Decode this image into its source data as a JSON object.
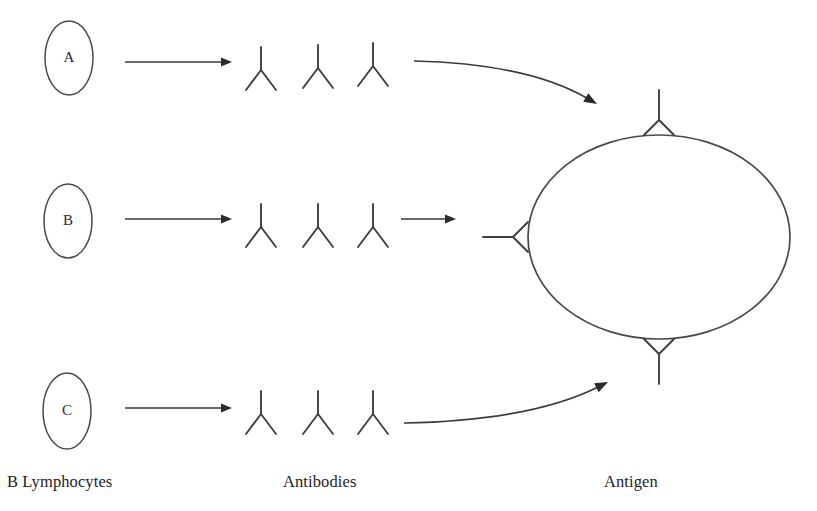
{
  "figure": {
    "background_color": "#ffffff",
    "ink_color": "#3a3a3a"
  },
  "columns": [
    {
      "id": "lymphocytes",
      "label": "B Lymphocytes",
      "x": 7,
      "y": 472
    },
    {
      "id": "antibodies",
      "label": "Antibodies",
      "x": 283,
      "y": 472
    },
    {
      "id": "antigen",
      "label": "Antigen",
      "x": 604,
      "y": 472
    }
  ],
  "lymphocytes": [
    {
      "id": "cell-a",
      "letter": "A",
      "cx": 69,
      "cy": 58,
      "rx": 24,
      "ry": 37
    },
    {
      "id": "cell-b",
      "letter": "B",
      "cx": 68,
      "cy": 221,
      "rx": 24,
      "ry": 37
    },
    {
      "id": "cell-c",
      "letter": "C",
      "cx": 67,
      "cy": 411,
      "rx": 24,
      "ry": 38
    }
  ],
  "production_arrows": [
    {
      "id": "arrow-a",
      "x1": 125,
      "y1": 62,
      "x2": 232,
      "y2": 62
    },
    {
      "id": "arrow-b",
      "x1": 125,
      "y1": 219,
      "x2": 232,
      "y2": 219
    },
    {
      "id": "arrow-c",
      "x1": 125,
      "y1": 408,
      "x2": 232,
      "y2": 408
    }
  ],
  "free_antibodies": [
    {
      "id": "ab-a1",
      "cx": 261,
      "cy": 70,
      "row": "A"
    },
    {
      "id": "ab-a2",
      "cx": 318,
      "cy": 68,
      "row": "A"
    },
    {
      "id": "ab-a3",
      "cx": 373,
      "cy": 66,
      "row": "A"
    },
    {
      "id": "ab-b1",
      "cx": 261,
      "cy": 227,
      "row": "B"
    },
    {
      "id": "ab-b2",
      "cx": 318,
      "cy": 227,
      "row": "B"
    },
    {
      "id": "ab-b3",
      "cx": 373,
      "cy": 227,
      "row": "B"
    },
    {
      "id": "ab-c1",
      "cx": 261,
      "cy": 414,
      "row": "C"
    },
    {
      "id": "ab-c2",
      "cx": 318,
      "cy": 414,
      "row": "C"
    },
    {
      "id": "ab-c3",
      "cx": 373,
      "cy": 414,
      "row": "C"
    }
  ],
  "binding_arrows": [
    {
      "id": "binding-arrow-top",
      "type": "curved",
      "from_x": 414,
      "from_y": 61,
      "to_x": 597,
      "to_y": 104,
      "direction": "down-right"
    },
    {
      "id": "binding-arrow-middle",
      "type": "straight",
      "from_x": 401,
      "from_y": 219,
      "to_x": 456,
      "to_y": 219,
      "direction": "right"
    },
    {
      "id": "binding-arrow-bottom",
      "type": "curved",
      "from_x": 404,
      "from_y": 423,
      "to_x": 608,
      "to_y": 382,
      "direction": "up-right"
    }
  ],
  "antigen": {
    "id": "antigen-body",
    "cx": 659,
    "cy": 237,
    "rx": 131,
    "ry": 102
  },
  "bound_antibodies": [
    {
      "id": "bound-antibody-top",
      "position": "top",
      "angle_deg": 270
    },
    {
      "id": "bound-antibody-left",
      "position": "left",
      "angle_deg": 180
    },
    {
      "id": "bound-antibody-bottom",
      "position": "bottom",
      "angle_deg": 90
    }
  ]
}
